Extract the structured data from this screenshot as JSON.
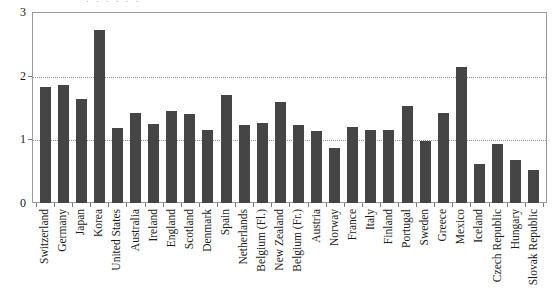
{
  "chart_data": {
    "type": "bar",
    "title": "",
    "xlabel": "",
    "ylabel": "",
    "ylim": [
      0,
      3
    ],
    "yticks": [
      0,
      1,
      2,
      3
    ],
    "ytick_labels": [
      "0",
      "1",
      "2",
      "3"
    ],
    "grid": "horizontal dotted gridlines at y = 1 and y = 2",
    "legend": "none",
    "bar_color": "#454545",
    "categories": [
      "Switzerland",
      "Germany",
      "Japan",
      "Korea",
      "United States",
      "Australia",
      "Ireland",
      "England",
      "Scotland",
      "Denmark",
      "Spain",
      "Netherlands",
      "Belgium (Fl.)",
      "New Zealand",
      "Belgium (Fr.)",
      "Austria",
      "Norway",
      "France",
      "Italy",
      "Finland",
      "Portugal",
      "Sweden",
      "Greece",
      "Mexico",
      "Iceland",
      "Czech Republic",
      "Hungary",
      "Slovak Republic"
    ],
    "values": [
      1.82,
      1.85,
      1.64,
      2.72,
      1.18,
      1.42,
      1.24,
      1.44,
      1.4,
      1.15,
      1.69,
      1.22,
      1.26,
      1.59,
      1.23,
      1.13,
      0.87,
      1.2,
      1.14,
      1.15,
      1.52,
      0.98,
      1.42,
      2.13,
      0.62,
      0.93,
      0.67,
      0.52
    ]
  },
  "axes": {
    "y_tick_0": "0",
    "y_tick_1": "1",
    "y_tick_2": "2",
    "y_tick_3": "3"
  },
  "caption_remnant": ". . . . . ."
}
